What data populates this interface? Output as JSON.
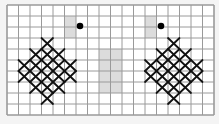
{
  "grid": {
    "origin_x": 7,
    "origin_y": 5,
    "cols": 18,
    "rows": 10,
    "cell_w": 11.5,
    "cell_h": 11,
    "line_color": "#9a9a9a",
    "background": "#ffffff",
    "shade_color": "#dcdcdc",
    "x_color": "#111111",
    "dot_color": "#000000"
  },
  "shaded_cells": [
    {
      "col": 5,
      "row": 1
    },
    {
      "col": 5,
      "row": 2
    },
    {
      "col": 12,
      "row": 1
    },
    {
      "col": 12,
      "row": 2
    },
    {
      "col": 8,
      "row": 4
    },
    {
      "col": 9,
      "row": 4
    },
    {
      "col": 8,
      "row": 5
    },
    {
      "col": 9,
      "row": 5
    },
    {
      "col": 8,
      "row": 6
    },
    {
      "col": 9,
      "row": 6
    },
    {
      "col": 8,
      "row": 7
    },
    {
      "col": 9,
      "row": 7
    }
  ],
  "dots": [
    {
      "x": 80,
      "y": 26
    },
    {
      "x": 161,
      "y": 26
    }
  ],
  "motifs": [
    {
      "name": "left-cross-stitch-diamond",
      "center_col": 3
    },
    {
      "name": "right-cross-stitch-diamond",
      "center_col": 14
    }
  ],
  "motif_rows": [
    {
      "row": 3,
      "span": 0
    },
    {
      "row": 4,
      "span": 1
    },
    {
      "row": 5,
      "span": 2
    },
    {
      "row": 6,
      "span": 2
    },
    {
      "row": 7,
      "span": 1
    },
    {
      "row": 8,
      "span": 0
    }
  ]
}
